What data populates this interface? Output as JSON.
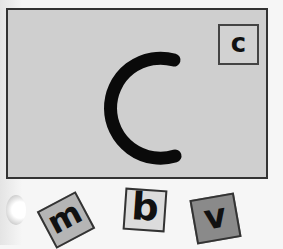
{
  "card": {
    "main_letter": "C",
    "corner_letter": "c",
    "background_color": "#cfcfcf"
  },
  "tiles": [
    {
      "letter": "m",
      "color": "#b5b5b5"
    },
    {
      "letter": "b",
      "color": "#dcdcdc"
    },
    {
      "letter": "v",
      "color": "#8a8a8a"
    }
  ]
}
